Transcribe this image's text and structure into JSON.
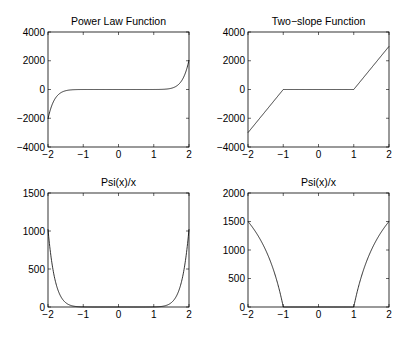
{
  "chart_data": [
    {
      "type": "line",
      "title": "Power Law Function",
      "xlabel": "",
      "ylabel": "",
      "xlim": [
        -2,
        2
      ],
      "ylim": [
        -4000,
        4000
      ],
      "xticks": [
        -2,
        -1,
        0,
        1,
        2
      ],
      "yticks": [
        -4000,
        -2000,
        0,
        2000,
        4000
      ],
      "xtick_labels": [
        "−2",
        "−1",
        "0",
        "1",
        "2"
      ],
      "ytick_labels": [
        "−4000",
        "−2000",
        "0",
        "2000",
        "4000"
      ],
      "grid": false,
      "series": [
        {
          "name": "f(x)",
          "formula": "x^11",
          "x": [
            -2,
            -1.5,
            -1,
            0,
            1,
            1.5,
            2
          ],
          "y": [
            -2048,
            -86.5,
            -1,
            0,
            1,
            86.5,
            2048
          ]
        }
      ]
    },
    {
      "type": "line",
      "title": "Two−slope Function",
      "xlabel": "",
      "ylabel": "",
      "xlim": [
        -2,
        2
      ],
      "ylim": [
        -4000,
        4000
      ],
      "xticks": [
        -2,
        -1,
        0,
        1,
        2
      ],
      "yticks": [
        -4000,
        -2000,
        0,
        2000,
        4000
      ],
      "xtick_labels": [
        "−2",
        "−1",
        "0",
        "1",
        "2"
      ],
      "ytick_labels": [
        "−4000",
        "−2000",
        "0",
        "2000",
        "4000"
      ],
      "grid": false,
      "series": [
        {
          "name": "f(x)",
          "x": [
            -2,
            -1,
            1,
            2
          ],
          "y": [
            -3000,
            0,
            0,
            3000
          ]
        }
      ]
    },
    {
      "type": "line",
      "title": "Psi(x)/x",
      "xlabel": "",
      "ylabel": "",
      "xlim": [
        -2,
        2
      ],
      "ylim": [
        0,
        1500
      ],
      "xticks": [
        -2,
        -1,
        0,
        1,
        2
      ],
      "yticks": [
        0,
        500,
        1000,
        1500
      ],
      "xtick_labels": [
        "−2",
        "−1",
        "0",
        "1",
        "2"
      ],
      "ytick_labels": [
        "0",
        "500",
        "1000",
        "1500"
      ],
      "grid": false,
      "series": [
        {
          "name": "Psi(x)/x",
          "formula": "x^10",
          "x": [
            -2,
            -1.5,
            -1,
            0,
            1,
            1.5,
            2
          ],
          "y": [
            1024,
            57.7,
            1,
            0,
            1,
            57.7,
            1024
          ]
        }
      ]
    },
    {
      "type": "line",
      "title": "Psi(x)/x",
      "xlabel": "",
      "ylabel": "",
      "xlim": [
        -2,
        2
      ],
      "ylim": [
        0,
        2000
      ],
      "xticks": [
        -2,
        -1,
        0,
        1,
        2
      ],
      "yticks": [
        0,
        500,
        1000,
        1500,
        2000
      ],
      "xtick_labels": [
        "−2",
        "−1",
        "0",
        "1",
        "2"
      ],
      "ytick_labels": [
        "0",
        "500",
        "1000",
        "1500",
        "2000"
      ],
      "grid": false,
      "series": [
        {
          "name": "Psi(x)/x",
          "x": [
            -2,
            -1.5,
            -1,
            1,
            1.5,
            2
          ],
          "y": [
            1500,
            1000,
            0,
            0,
            1000,
            1500
          ]
        }
      ]
    }
  ],
  "layout": {
    "panels": [
      {
        "left": 48,
        "top": 32,
        "right": 189,
        "bottom": 147
      },
      {
        "left": 248,
        "top": 32,
        "right": 389,
        "bottom": 147
      },
      {
        "left": 48,
        "top": 193,
        "right": 189,
        "bottom": 307
      },
      {
        "left": 248,
        "top": 193,
        "right": 389,
        "bottom": 307
      }
    ],
    "line_color": "#000000",
    "axis_color": "#000000"
  }
}
